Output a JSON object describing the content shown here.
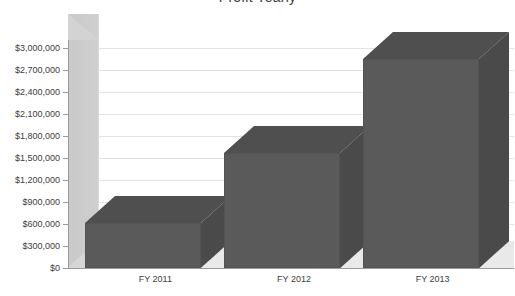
{
  "chart_data": {
    "type": "bar",
    "title": "Profit Yearly",
    "subtitle": "",
    "xlabel": "",
    "ylabel": "",
    "categories": [
      "FY 2011",
      "FY 2012",
      "FY 2013"
    ],
    "values": [
      980000,
      1940000,
      3220000
    ],
    "series": [
      {
        "name": "Profit",
        "values": [
          980000,
          1940000,
          3220000
        ]
      }
    ],
    "ylim": [
      0,
      3300000
    ],
    "ytick_values": [
      0,
      300000,
      600000,
      900000,
      1200000,
      1500000,
      1800000,
      2100000,
      2400000,
      2700000,
      3000000
    ],
    "ytick_labels": [
      "$0",
      "$300,000",
      "$600,000",
      "$900,000",
      "$1,200,000",
      "$1,500,000",
      "$1,800,000",
      "$2,100,000",
      "$2,400,000",
      "$2,700,000",
      "$3,000,000"
    ],
    "grid": true,
    "grid_axis": "y",
    "legend": false,
    "legend_position": "none",
    "three_d": true,
    "annotations": [],
    "colors": {
      "bar_front": "#5a5a5a",
      "bar_top": "#4f4f4f",
      "bar_side": "#4a4a4a",
      "wall": "#c9c9c9",
      "plot_background": "#ffffff",
      "gridline": "#e3e3e3",
      "axis": "#9a9a9a",
      "text": "#3d3d3d",
      "page_background": "#ffffff"
    }
  },
  "title": {
    "text": "Profit Yearly"
  },
  "axis": {
    "y": {
      "labels": [
        "$3,000,000",
        "$2,700,000",
        "$2,400,000",
        "$2,100,000",
        "$1,800,000",
        "$1,500,000",
        "$1,200,000",
        "$900,000",
        "$600,000",
        "$300,000",
        "$0"
      ]
    },
    "x": {
      "labels": [
        "FY 2011",
        "FY 2012",
        "FY 2013"
      ]
    }
  }
}
